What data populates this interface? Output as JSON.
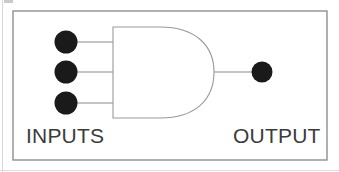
{
  "diagram": {
    "gate_type": "AND",
    "labels": {
      "inputs": "INPUTS",
      "output": "OUTPUT"
    },
    "colors": {
      "background": "#ffffff",
      "frame_border": "#8f8f8f",
      "gate_outline": "#9a9a9a",
      "wire": "#8a8a8a",
      "terminal_fill": "#1a1a1a",
      "label_text": "#3b3b3b",
      "page_edge": "#d8d8d8"
    },
    "frame": {
      "x": 13,
      "y": 11,
      "width": 314,
      "height": 149,
      "stroke_width": 1.4
    },
    "gate_body": {
      "left_x": 113,
      "top_y": 27,
      "bottom_y": 118,
      "right_x": 214,
      "stroke_width": 1.1
    },
    "input_terminals": [
      {
        "id": "input-terminal-1",
        "cx": 66,
        "cy": 42,
        "r": 11.5,
        "wire_to_x": 113
      },
      {
        "id": "input-terminal-2",
        "cx": 66,
        "cy": 72,
        "r": 11.5,
        "wire_to_x": 113
      },
      {
        "id": "input-terminal-3",
        "cx": 66,
        "cy": 103,
        "r": 11.5,
        "wire_to_x": 113
      }
    ],
    "output_terminal": {
      "id": "output-terminal",
      "cx": 262,
      "cy": 72,
      "r": 10.5,
      "wire_from_x": 214
    }
  }
}
